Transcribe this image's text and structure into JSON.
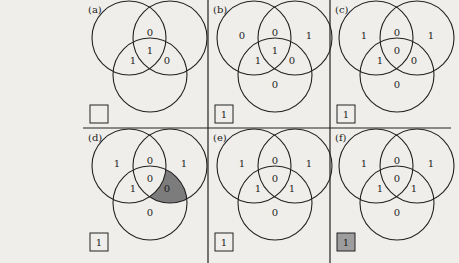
{
  "figure": {
    "background_color": "#efeeea",
    "line_color": "#222222",
    "shade_color": "#7c7c7c",
    "box_shade_color": "#9d9d9d",
    "panels": [
      {
        "id": "a",
        "label": "(a)",
        "regions": {
          "top_left": "",
          "top_right": "",
          "top_mid": "0",
          "center": "1",
          "left_mid": "1",
          "right_mid": "0",
          "bottom": ""
        },
        "shaded_region": null,
        "box_value": "",
        "box_shaded": false
      },
      {
        "id": "b",
        "label": "(b)",
        "regions": {
          "top_left": "0",
          "top_right": "1",
          "top_mid": "0",
          "center": "1",
          "left_mid": "1",
          "right_mid": "0",
          "bottom": "0"
        },
        "shaded_region": null,
        "box_value": "1",
        "box_shaded": false
      },
      {
        "id": "c",
        "label": "(c)",
        "regions": {
          "top_left": "1",
          "top_right": "1",
          "top_mid": "0",
          "center": "0",
          "left_mid": "1",
          "right_mid": "0",
          "bottom": "0"
        },
        "shaded_region": null,
        "box_value": "1",
        "box_shaded": false
      },
      {
        "id": "d",
        "label": "(d)",
        "regions": {
          "top_left": "1",
          "top_right": "1",
          "top_mid": "0",
          "center": "0",
          "left_mid": "1",
          "right_mid": "0",
          "bottom": "0"
        },
        "shaded_region": "right_mid",
        "box_value": "1",
        "box_shaded": false
      },
      {
        "id": "e",
        "label": "(e)",
        "regions": {
          "top_left": "1",
          "top_right": "1",
          "top_mid": "0",
          "center": "0",
          "left_mid": "1",
          "right_mid": "1",
          "bottom": "0"
        },
        "shaded_region": null,
        "box_value": "1",
        "box_shaded": false
      },
      {
        "id": "f",
        "label": "(f)",
        "regions": {
          "top_left": "1",
          "top_right": "1",
          "top_mid": "0",
          "center": "0",
          "left_mid": "1",
          "right_mid": "1",
          "bottom": "0"
        },
        "shaded_region": null,
        "box_value": "1",
        "box_shaded": true
      }
    ]
  }
}
